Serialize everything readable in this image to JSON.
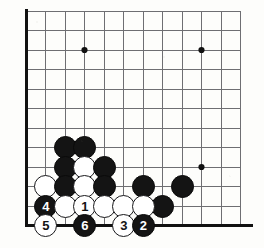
{
  "figure": {
    "kind": "go-board-diagram",
    "background_color": "#fdfdfb"
  },
  "board": {
    "origin_x": 26,
    "origin_y": 11,
    "cell_size": 19.5,
    "cols": 12,
    "rows": 12,
    "grid_color": "#6e6e72",
    "grid_line_width": 1,
    "edge_color": "#111111",
    "edge_line_width": 3,
    "left_edge_col": 0,
    "bottom_edge_row": 11,
    "star_point_color": "#111111",
    "star_point_radius": 3.1,
    "star_points": [
      {
        "col": 3,
        "row": 2
      },
      {
        "col": 9,
        "row": 2
      },
      {
        "col": 9,
        "row": 8
      }
    ]
  },
  "stone_style": {
    "diameter": 23,
    "black_fill": "#141414",
    "white_fill": "#ffffff",
    "white_border": "#17171a",
    "black_label_color": "#ffffff",
    "white_label_color": "#141414"
  },
  "stones": [
    {
      "id": "b-c2r7",
      "color": "black",
      "col": 2,
      "row": 7,
      "label": ""
    },
    {
      "id": "b-c3r7",
      "color": "black",
      "col": 3,
      "row": 7,
      "label": ""
    },
    {
      "id": "b-c2r8",
      "color": "black",
      "col": 2,
      "row": 8,
      "label": ""
    },
    {
      "id": "w-c3r8",
      "color": "white",
      "col": 3,
      "row": 8,
      "label": ""
    },
    {
      "id": "b-c4r8",
      "color": "black",
      "col": 4,
      "row": 8,
      "label": ""
    },
    {
      "id": "w-c1r9",
      "color": "white",
      "col": 1,
      "row": 9,
      "label": ""
    },
    {
      "id": "b-c2r9",
      "color": "black",
      "col": 2,
      "row": 9,
      "label": ""
    },
    {
      "id": "w-c3r9",
      "color": "white",
      "col": 3,
      "row": 9,
      "label": ""
    },
    {
      "id": "b-c4r9",
      "color": "black",
      "col": 4,
      "row": 9,
      "label": ""
    },
    {
      "id": "b-c6r9",
      "color": "black",
      "col": 6,
      "row": 9,
      "label": ""
    },
    {
      "id": "b-c8r9",
      "color": "black",
      "col": 8,
      "row": 9,
      "label": ""
    },
    {
      "id": "b-c7r10",
      "color": "black",
      "col": 7,
      "row": 10,
      "label": ""
    },
    {
      "id": "b-c1r10",
      "color": "black",
      "col": 1,
      "row": 10,
      "label": "4"
    },
    {
      "id": "w-c2r10",
      "color": "white",
      "col": 2,
      "row": 10,
      "label": ""
    },
    {
      "id": "w-c3r10",
      "color": "white",
      "col": 3,
      "row": 10,
      "label": "1"
    },
    {
      "id": "w-c4r10",
      "color": "white",
      "col": 4,
      "row": 10,
      "label": ""
    },
    {
      "id": "w-c5r10",
      "color": "white",
      "col": 5,
      "row": 10,
      "label": ""
    },
    {
      "id": "w-c6r10",
      "color": "white",
      "col": 6,
      "row": 10,
      "label": ""
    },
    {
      "id": "w-c1r11",
      "color": "white",
      "col": 1,
      "row": 11,
      "label": "5"
    },
    {
      "id": "b-c3r11",
      "color": "black",
      "col": 3,
      "row": 11,
      "label": "6"
    },
    {
      "id": "w-c5r11",
      "color": "white",
      "col": 5,
      "row": 11,
      "label": "3"
    },
    {
      "id": "b-c6r11",
      "color": "black",
      "col": 6,
      "row": 11,
      "label": "2"
    }
  ],
  "move_sequence": [
    {
      "number": "1",
      "color": "white",
      "col": 3,
      "row": 10
    },
    {
      "number": "2",
      "color": "black",
      "col": 6,
      "row": 11
    },
    {
      "number": "3",
      "color": "white",
      "col": 5,
      "row": 11
    },
    {
      "number": "4",
      "color": "black",
      "col": 1,
      "row": 10
    },
    {
      "number": "5",
      "color": "white",
      "col": 1,
      "row": 11
    },
    {
      "number": "6",
      "color": "black",
      "col": 3,
      "row": 11
    }
  ]
}
